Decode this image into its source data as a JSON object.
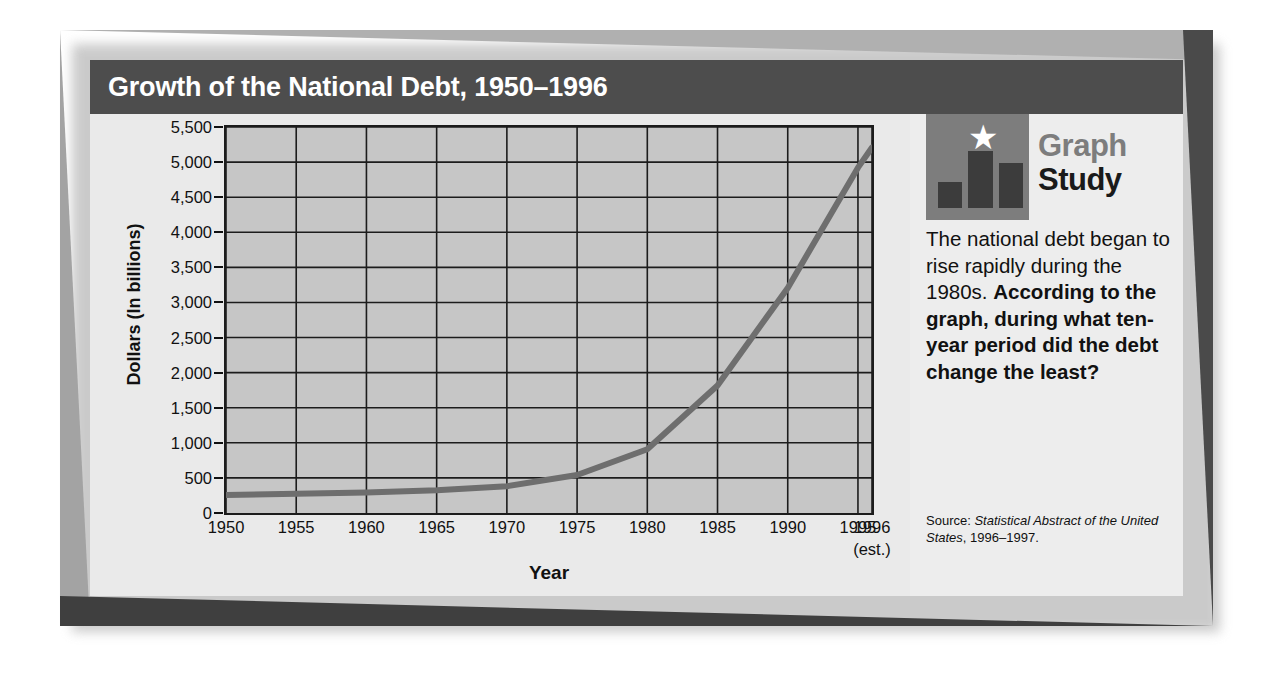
{
  "title": "Growth of the National Debt, 1950–1996",
  "axes": {
    "ylabel": "Dollars (In billions)",
    "xlabel": "Year",
    "x_last_sub": "(est.)"
  },
  "side_panel": {
    "logo": {
      "word_top": "Graph",
      "word_bottom": "Study",
      "star_glyph": "★"
    },
    "intro_text": "The national debt began to rise rapidly during the 1980s. ",
    "question_text": "According to the graph, during what ten-year period did the debt change the least?",
    "source_prefix": "Source: ",
    "source_title": "Statistical Abstract of the United States",
    "source_suffix": ", 1996–1997."
  },
  "colors": {
    "frame_light": "#b0b0b0",
    "frame_dark": "#3f3f3f",
    "title_bar": "#4d4d4d",
    "plot_fill": "#c6c6c6",
    "grid": "#1c1c1c",
    "line": "#6e6e6e",
    "logo_box": "#7d7d7d"
  },
  "chart_data": {
    "type": "line",
    "title": "Growth of the National Debt, 1950–1996",
    "xlabel": "Year",
    "ylabel": "Dollars (In billions)",
    "xlim": [
      1950,
      1996
    ],
    "ylim": [
      0,
      5500
    ],
    "grid": true,
    "legend": null,
    "ytick_labels": [
      "0",
      "500",
      "1,000",
      "1,500",
      "2,000",
      "2,500",
      "3,000",
      "3,500",
      "4,000",
      "4,500",
      "5,000",
      "5,500"
    ],
    "ytick_values": [
      0,
      500,
      1000,
      1500,
      2000,
      2500,
      3000,
      3500,
      4000,
      4500,
      5000,
      5500
    ],
    "xtick_labels": [
      "1950",
      "1955",
      "1960",
      "1965",
      "1970",
      "1975",
      "1980",
      "1985",
      "1990",
      "1995",
      "1996"
    ],
    "xtick_values": [
      1950,
      1955,
      1960,
      1965,
      1970,
      1975,
      1980,
      1985,
      1990,
      1995,
      1996
    ],
    "x": [
      1950,
      1955,
      1960,
      1965,
      1970,
      1975,
      1980,
      1985,
      1990,
      1995,
      1996
    ],
    "values": [
      257,
      274,
      291,
      323,
      381,
      542,
      909,
      1817,
      3207,
      4921,
      5207
    ],
    "series": [
      {
        "name": "National debt",
        "values": [
          257,
          274,
          291,
          323,
          381,
          542,
          909,
          1817,
          3207,
          4921,
          5207
        ]
      }
    ],
    "annotations": [
      "1996 value is an estimate"
    ]
  }
}
